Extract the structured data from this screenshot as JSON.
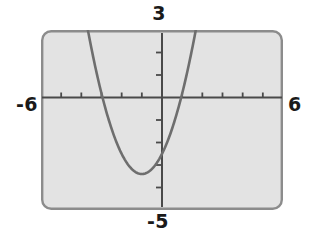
{
  "figure": {
    "kind": "graphing-calculator-screen",
    "background_color": "#ffffff",
    "screen_fill_color": "#e3e3e3",
    "screen_border_color": "#8c8c8c",
    "axis_color": "#4a4a4a",
    "curve_color": "#6e6e6e"
  },
  "labels": {
    "y_max": "3",
    "y_min": "-5",
    "x_min": "-6",
    "x_max": "6"
  },
  "chart_data": {
    "type": "line",
    "title": "",
    "xlabel": "",
    "ylabel": "",
    "xlim": [
      -6,
      6
    ],
    "ylim": [
      -5,
      3
    ],
    "grid": false,
    "legend": "none",
    "x_tick_labels": [
      "-6",
      "6"
    ],
    "y_tick_labels": [
      "3",
      "-5"
    ],
    "x_tick_values": [
      -5,
      -4,
      -3,
      -2,
      -1,
      0,
      1,
      2,
      3,
      4,
      5
    ],
    "y_tick_values": [
      -4,
      -3,
      -2,
      -1,
      0,
      1,
      2
    ],
    "tick_spacing": 1,
    "annotations": [],
    "series": [
      {
        "name": "parabola",
        "equation": "y = 0.9(x + 1)^2 - 3.4",
        "vertex": [
          -1.0,
          -3.4
        ],
        "x_intercepts": [
          -2.95,
          0.95
        ],
        "y_intercept": -2.5,
        "opens": "up",
        "x": [
          -2.45,
          -2.3,
          -2.1,
          -1.9,
          -1.7,
          -1.5,
          -1.3,
          -1.1,
          -0.9,
          -0.7,
          -0.5,
          -0.3,
          -0.1,
          0.1,
          0.3,
          0.5,
          0.7,
          0.9,
          1.1,
          1.3,
          1.45
        ],
        "y": [
          2.41,
          1.78,
          1.09,
          0.49,
          0.01,
          -0.36,
          -0.67,
          -3.39,
          -3.39,
          -3.32,
          -3.18,
          -2.96,
          -2.67,
          -2.31,
          -1.88,
          -1.38,
          -0.81,
          -0.17,
          -0.29,
          1.23,
          2.41
        ]
      }
    ]
  }
}
